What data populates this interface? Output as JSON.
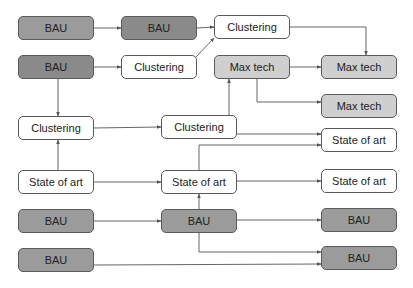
{
  "diagram": {
    "colors": {
      "bau_fill": "#9b9b9b",
      "bau_dark_fill": "#8a8a8a",
      "maxtech_fill": "#cfcfcf",
      "plain_fill": "#ffffff",
      "border": "#5a5a5a",
      "edge": "#555555"
    },
    "nodes": [
      {
        "id": "n1",
        "label": "BAU",
        "style": "bau",
        "x": 18,
        "y": 16
      },
      {
        "id": "n2",
        "label": "BAU",
        "style": "bau-dark",
        "x": 121,
        "y": 16
      },
      {
        "id": "n3",
        "label": "Clustering",
        "style": "plain",
        "x": 214,
        "y": 15
      },
      {
        "id": "n4",
        "label": "BAU",
        "style": "bau-dark",
        "x": 18,
        "y": 55
      },
      {
        "id": "n5",
        "label": "Clustering",
        "style": "plain",
        "x": 121,
        "y": 55
      },
      {
        "id": "n6",
        "label": "Max tech",
        "style": "maxtech",
        "x": 214,
        "y": 55
      },
      {
        "id": "n7",
        "label": "Max tech",
        "style": "maxtech",
        "x": 321,
        "y": 55
      },
      {
        "id": "n8",
        "label": "Max tech",
        "style": "maxtech",
        "x": 321,
        "y": 94
      },
      {
        "id": "n9",
        "label": "Clustering",
        "style": "plain",
        "x": 18,
        "y": 116
      },
      {
        "id": "n10",
        "label": "Clustering",
        "style": "plain",
        "x": 161,
        "y": 115
      },
      {
        "id": "n11",
        "label": "State of art",
        "style": "plain",
        "x": 321,
        "y": 128
      },
      {
        "id": "n12",
        "label": "State of art",
        "style": "plain",
        "x": 18,
        "y": 170
      },
      {
        "id": "n13",
        "label": "State of art",
        "style": "plain",
        "x": 161,
        "y": 170
      },
      {
        "id": "n14",
        "label": "State of art",
        "style": "plain",
        "x": 321,
        "y": 169
      },
      {
        "id": "n15",
        "label": "BAU",
        "style": "bau",
        "x": 18,
        "y": 209
      },
      {
        "id": "n16",
        "label": "BAU",
        "style": "bau",
        "x": 161,
        "y": 209
      },
      {
        "id": "n17",
        "label": "BAU",
        "style": "bau",
        "x": 321,
        "y": 208
      },
      {
        "id": "n18",
        "label": "BAU",
        "style": "bau",
        "x": 18,
        "y": 248
      },
      {
        "id": "n19",
        "label": "BAU",
        "style": "bau",
        "x": 321,
        "y": 246
      }
    ],
    "edges": [
      {
        "from": "n1",
        "to": "n2",
        "points": [
          [
            94,
            28
          ],
          [
            121,
            28
          ]
        ]
      },
      {
        "from": "n2",
        "to": "n3",
        "points": [
          [
            197,
            28
          ],
          [
            214,
            27
          ]
        ]
      },
      {
        "from": "n4",
        "to": "n5",
        "points": [
          [
            94,
            67
          ],
          [
            121,
            67
          ]
        ]
      },
      {
        "from": "n5",
        "to": "n3",
        "points": [
          [
            196,
            57
          ],
          [
            214,
            38
          ]
        ]
      },
      {
        "from": "n3",
        "to": "n7",
        "points": [
          [
            290,
            27
          ],
          [
            366,
            27
          ],
          [
            366,
            55
          ]
        ]
      },
      {
        "from": "n6",
        "to": "n7",
        "points": [
          [
            290,
            67
          ],
          [
            321,
            67
          ]
        ]
      },
      {
        "from": "n6",
        "to": "n8",
        "points": [
          [
            257,
            79
          ],
          [
            257,
            102
          ],
          [
            321,
            102
          ]
        ]
      },
      {
        "from": "n4",
        "to": "n9",
        "points": [
          [
            58,
            79
          ],
          [
            58,
            116
          ]
        ]
      },
      {
        "from": "n9",
        "to": "n10",
        "points": [
          [
            94,
            128
          ],
          [
            161,
            127
          ]
        ]
      },
      {
        "from": "n10",
        "to": "n6",
        "points": [
          [
            229,
            115
          ],
          [
            229,
            79
          ]
        ]
      },
      {
        "from": "n10",
        "to": "n11",
        "points": [
          [
            237,
            134
          ],
          [
            321,
            134
          ]
        ]
      },
      {
        "from": "n12",
        "to": "n9",
        "points": [
          [
            58,
            170
          ],
          [
            58,
            140
          ]
        ]
      },
      {
        "from": "n12",
        "to": "n13",
        "points": [
          [
            94,
            182
          ],
          [
            161,
            182
          ]
        ]
      },
      {
        "from": "n13",
        "to": "n11",
        "points": [
          [
            199,
            170
          ],
          [
            199,
            145
          ],
          [
            321,
            145
          ]
        ]
      },
      {
        "from": "n13",
        "to": "n14",
        "points": [
          [
            237,
            181
          ],
          [
            321,
            181
          ]
        ]
      },
      {
        "from": "n15",
        "to": "n16",
        "points": [
          [
            94,
            221
          ],
          [
            161,
            221
          ]
        ]
      },
      {
        "from": "n16",
        "to": "n13",
        "points": [
          [
            199,
            209
          ],
          [
            199,
            194
          ]
        ]
      },
      {
        "from": "n16",
        "to": "n17",
        "points": [
          [
            237,
            220
          ],
          [
            321,
            220
          ]
        ]
      },
      {
        "from": "n16",
        "to": "n19",
        "points": [
          [
            199,
            233
          ],
          [
            199,
            252
          ],
          [
            321,
            252
          ]
        ]
      },
      {
        "from": "n18",
        "to": "n19",
        "points": [
          [
            94,
            265
          ],
          [
            321,
            264
          ]
        ]
      }
    ]
  }
}
